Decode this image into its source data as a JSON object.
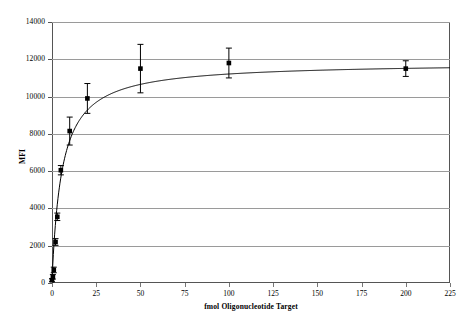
{
  "chart_data": {
    "type": "scatter",
    "title": "",
    "xlabel": "fmol Oligonucleotide Target",
    "ylabel": "MFI",
    "xlim": [
      0,
      225
    ],
    "ylim": [
      0,
      14000
    ],
    "grid": true,
    "grid_axis": "y",
    "legend": "none",
    "marker": "filled-square",
    "line": "fitted-saturation-curve",
    "errorbars": "vertical",
    "xticks": [
      0,
      25,
      50,
      75,
      100,
      125,
      150,
      175,
      200,
      225
    ],
    "xtick_labels": [
      "0",
      "25",
      "50",
      "75",
      "100",
      "125",
      "150",
      "175",
      "200",
      "225"
    ],
    "yticks": [
      0,
      2000,
      4000,
      6000,
      8000,
      10000,
      12000,
      14000
    ],
    "ytick_labels": [
      "0",
      "2000",
      "4000",
      "6000",
      "8000",
      "10000",
      "12000",
      "14000"
    ],
    "x": [
      0,
      0.5,
      1,
      2,
      3,
      5,
      10,
      20,
      50,
      100,
      200
    ],
    "values": [
      150,
      330,
      700,
      2200,
      3550,
      6050,
      8150,
      9900,
      11500,
      11800,
      11500
    ],
    "errors": [
      80,
      120,
      150,
      180,
      200,
      250,
      750,
      800,
      1300,
      800,
      420
    ],
    "series": [
      {
        "name": "MFI",
        "color": "#000000",
        "points": [
          {
            "x": 0,
            "y": 150,
            "err": 80
          },
          {
            "x": 0.5,
            "y": 330,
            "err": 120
          },
          {
            "x": 1,
            "y": 700,
            "err": 150
          },
          {
            "x": 2,
            "y": 2200,
            "err": 180
          },
          {
            "x": 3,
            "y": 3550,
            "err": 200
          },
          {
            "x": 5,
            "y": 6050,
            "err": 250
          },
          {
            "x": 10,
            "y": 8150,
            "err": 750
          },
          {
            "x": 20,
            "y": 9900,
            "err": 800
          },
          {
            "x": 50,
            "y": 11500,
            "err": 1300
          },
          {
            "x": 100,
            "y": 11800,
            "err": 800
          },
          {
            "x": 200,
            "y": 11500,
            "err": 420
          }
        ]
      }
    ],
    "curve": {
      "model": "saturation",
      "ymax": 11830,
      "k": 5.6,
      "y0": 150
    }
  },
  "colors": {
    "axis": "#555555",
    "grid": "#9a9a9a",
    "data": "#000000",
    "background": "#ffffff"
  }
}
